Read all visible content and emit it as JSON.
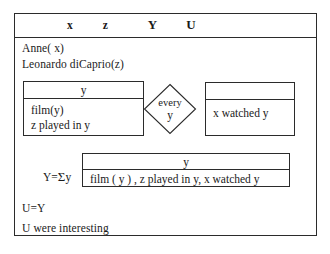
{
  "diagram": {
    "type": "drs-box-diagram",
    "outer_box": {
      "universe": [
        "x",
        "z",
        "Y",
        "U"
      ],
      "conditions": [
        "Anne( x)",
        "Leonardo diCaprio(z)"
      ],
      "trailing_conditions": [
        "U=Y",
        "U were interesting"
      ]
    },
    "duplex_condition": {
      "restrictor": {
        "universe": "y",
        "conditions": [
          "film(y)",
          "z played in y"
        ]
      },
      "quantifier": {
        "word": "every",
        "variable": "y"
      },
      "scope": {
        "universe": "",
        "conditions": [
          "x watched y"
        ]
      }
    },
    "summation": {
      "label_prefix": "Y=",
      "label_sigma": "Σ",
      "label_suffix": "y",
      "box": {
        "universe": "y",
        "conditions": [
          "film ( y ) , z played in y, x watched y"
        ]
      }
    }
  },
  "colors": {
    "stroke": "#2b2b2b",
    "background": "#ffffff",
    "text": "#1a1a1a"
  }
}
